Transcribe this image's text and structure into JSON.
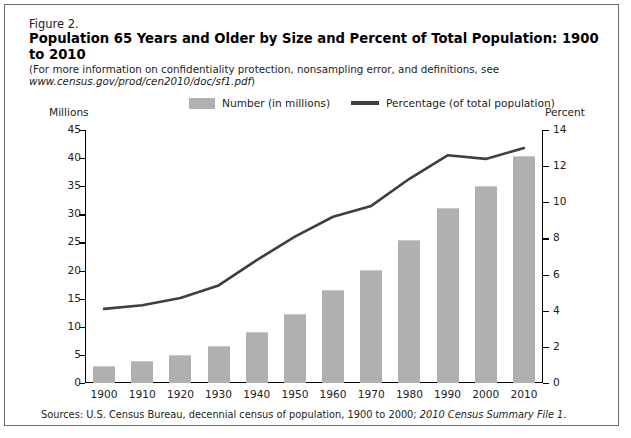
{
  "figure": {
    "number": "Figure 2.",
    "title": "Population 65 Years and Older by Size and Percent of Total Population: 1900 to 2010",
    "note_plain_1": "(For more information on confidentiality protection, nonsampling error, and definitions, see ",
    "note_italic_1": "www.census.gov",
    "note_italic_2": "/prod/cen2010/doc/sf1.pdf",
    "note_plain_2": ")",
    "sources_plain_1": "Sources: U.S. Census Bureau, decennial census of population, 1900 to 2000; ",
    "sources_italic": "2010 Census Summary File 1",
    "sources_plain_2": "."
  },
  "legend": {
    "bar_label": "Number (in millions)",
    "line_label": "Percentage (of total population)",
    "bar_color": "#b0b0b0",
    "line_color": "#3f3f3f"
  },
  "axes": {
    "left_caption": "Millions",
    "right_caption": "Percent"
  },
  "chart_data": {
    "type": "bar",
    "title": "Population 65 Years and Older by Size and Percent of Total Population: 1900 to 2010",
    "xlabel": "",
    "ylabel": "Millions",
    "y2label": "Percent",
    "ylim": [
      0,
      45
    ],
    "y2lim": [
      0,
      14
    ],
    "ytick_labels": [
      "45",
      "40",
      "35",
      "30",
      "25",
      "20",
      "15",
      "10",
      "5",
      "0"
    ],
    "yticks": [
      45,
      40,
      35,
      30,
      25,
      20,
      15,
      10,
      5,
      0
    ],
    "y2tick_labels": [
      "14",
      "12",
      "10",
      "8",
      "6",
      "4",
      "2",
      "0"
    ],
    "y2ticks": [
      14,
      12,
      10,
      8,
      6,
      4,
      2,
      0
    ],
    "grid": false,
    "legend_position": "top",
    "categories": [
      "1900",
      "1910",
      "1920",
      "1930",
      "1940",
      "1950",
      "1960",
      "1970",
      "1980",
      "1990",
      "2000",
      "2010"
    ],
    "series": [
      {
        "name": "Number (in millions)",
        "type": "bar",
        "axis": "left",
        "color": "#b0b0b0",
        "values": [
          3.1,
          3.9,
          4.9,
          6.6,
          9.0,
          12.3,
          16.6,
          20.1,
          25.5,
          31.2,
          35.0,
          40.3
        ]
      },
      {
        "name": "Percentage (of total population)",
        "type": "line",
        "axis": "right",
        "color": "#3f3f3f",
        "values": [
          4.1,
          4.3,
          4.7,
          5.4,
          6.8,
          8.1,
          9.2,
          9.8,
          11.3,
          12.6,
          12.4,
          13.0
        ]
      }
    ]
  }
}
